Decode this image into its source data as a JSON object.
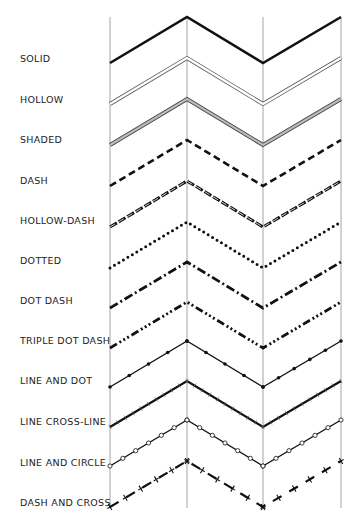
{
  "colors": {
    "line": "#111111",
    "grid": "#9a9a9a",
    "background": "#ffffff"
  },
  "grid": {
    "x": [
      110,
      187,
      263,
      341
    ],
    "top": 17,
    "bottom": 508
  },
  "styles": [
    {
      "label": "SOLID",
      "style": "solid",
      "peak": 17,
      "label_y": 58
    },
    {
      "label": "HOLLOW",
      "style": "hollow",
      "peak": 58,
      "label_y": 99
    },
    {
      "label": "SHADED",
      "style": "shaded",
      "peak": 99,
      "label_y": 139
    },
    {
      "label": "DASH",
      "style": "dash",
      "peak": 140,
      "label_y": 180
    },
    {
      "label": "HOLLOW-DASH",
      "style": "hollow-dash",
      "peak": 181,
      "label_y": 220
    },
    {
      "label": "DOTTED",
      "style": "dotted",
      "peak": 222,
      "label_y": 260
    },
    {
      "label": "DOT DASH",
      "style": "dot-dash",
      "peak": 262,
      "label_y": 300
    },
    {
      "label": "TRIPLE DOT DASH",
      "style": "triple-dot-dash",
      "peak": 302,
      "label_y": 340
    },
    {
      "label": "LINE AND DOT",
      "style": "line-dot",
      "peak": 341,
      "label_y": 380
    },
    {
      "label": "LINE CROSS-LINE",
      "style": "line-cross",
      "peak": 381,
      "label_y": 421
    },
    {
      "label": "LINE AND CIRCLE",
      "style": "line-circle",
      "peak": 420,
      "label_y": 462
    },
    {
      "label": "DASH AND CROSS",
      "style": "dash-cross",
      "peak": 461,
      "label_y": 502
    }
  ],
  "amplitude": 46
}
